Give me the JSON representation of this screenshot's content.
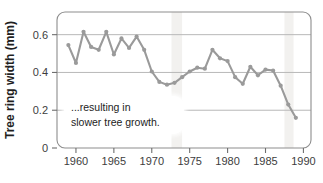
{
  "chart_data": {
    "type": "line",
    "title": "",
    "subtitle": "",
    "xlabel": "",
    "ylabel": "Tree ring width (mm)",
    "xlim": [
      1957.5,
      1991.0
    ],
    "ylim": [
      0,
      0.72
    ],
    "grid": "horizontal",
    "legend": "none",
    "xticks": [
      1960,
      1965,
      1970,
      1975,
      1980,
      1985,
      1990
    ],
    "xtick_labels": [
      "1960",
      "1965",
      "1970",
      "1975",
      "1980",
      "1985",
      "1990"
    ],
    "yticks": [
      0,
      0.2,
      0.4,
      0.6
    ],
    "ytick_labels": [
      "0",
      "0.2",
      "0.4",
      "0.6"
    ],
    "series": [
      {
        "name": "Tree ring width",
        "color": "#9a9a9a",
        "marker": "circle",
        "x": [
          1959,
          1960,
          1961,
          1962,
          1963,
          1964,
          1965,
          1966,
          1967,
          1968,
          1969,
          1970,
          1971,
          1972,
          1973,
          1974,
          1975,
          1976,
          1977,
          1978,
          1979,
          1980,
          1981,
          1982,
          1983,
          1984,
          1985,
          1986,
          1987,
          1988,
          1989
        ],
        "values": [
          0.545,
          0.45,
          0.615,
          0.535,
          0.52,
          0.615,
          0.495,
          0.58,
          0.53,
          0.59,
          0.52,
          0.405,
          0.35,
          0.335,
          0.345,
          0.375,
          0.405,
          0.425,
          0.42,
          0.52,
          0.475,
          0.46,
          0.375,
          0.34,
          0.43,
          0.385,
          0.415,
          0.41,
          0.33,
          0.23,
          0.16
        ]
      }
    ],
    "annotations": [
      {
        "name": "slower-growth-callout",
        "line1": "...resulting in",
        "line2": "slower tree growth."
      }
    ],
    "shaded_bands": [
      {
        "name": "band-1973",
        "start": 1972.6,
        "end": 1974.0
      },
      {
        "name": "band-1988",
        "start": 1987.5,
        "end": 1988.7
      }
    ],
    "colors": {
      "line": "#9a9a9a",
      "marker": "#9a9a9a",
      "grid": "#b8b8b8",
      "axis": "#6e6e6e",
      "band": "#f2f1ef",
      "tick_text": "#3d3d3d",
      "axis_title": "#1f1f1f",
      "annotation_text": "#232323",
      "annotation_bg": "#ffffff",
      "background": "#ffffff"
    }
  }
}
